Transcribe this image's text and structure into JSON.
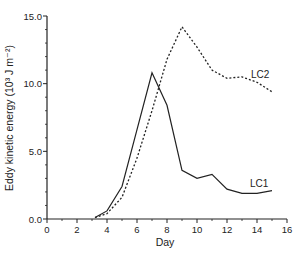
{
  "chart_data": {
    "type": "line",
    "title": "",
    "xlabel": "Day",
    "ylabel": "Eddy kinetic energy (10³ J m⁻²)",
    "xlim": [
      0,
      16
    ],
    "ylim": [
      0,
      15
    ],
    "x_ticks": [
      0,
      2,
      4,
      6,
      8,
      10,
      12,
      14,
      16
    ],
    "x_tick_labels": [
      "0",
      "2",
      "4",
      "6",
      "8",
      "10",
      "12",
      "14",
      "16"
    ],
    "y_ticks": [
      0,
      5,
      10,
      15
    ],
    "y_tick_labels": [
      "0.0",
      "5.0",
      "10.0",
      "15.0"
    ],
    "grid": false,
    "legend": "inline labels near line ends",
    "series": [
      {
        "name": "LC1",
        "style": "solid",
        "x": [
          3.2,
          4,
          5,
          6,
          7,
          8,
          9,
          10,
          11,
          12,
          13,
          14,
          15
        ],
        "values": [
          0.1,
          0.6,
          2.4,
          6.6,
          10.8,
          8.4,
          3.6,
          3.0,
          3.3,
          2.2,
          1.9,
          1.9,
          2.1
        ]
      },
      {
        "name": "LC2",
        "style": "dotted",
        "x": [
          3.2,
          4,
          5,
          6,
          7,
          8,
          9,
          10,
          11,
          12,
          13,
          14,
          15
        ],
        "values": [
          0.1,
          0.4,
          1.6,
          4.5,
          8.0,
          11.8,
          14.2,
          12.7,
          11.0,
          10.4,
          10.5,
          10.1,
          9.4
        ]
      }
    ]
  },
  "labels": {
    "xlabel": "Day",
    "ylabel": "Eddy kinetic energy (10³ J m⁻²)",
    "lc1": "LC1",
    "lc2": "LC2"
  }
}
